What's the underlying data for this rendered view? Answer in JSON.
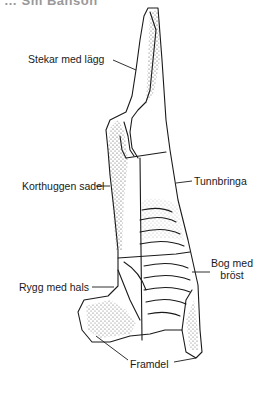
{
  "header": {
    "cut_text": "… Sm Banson"
  },
  "diagram": {
    "labels": {
      "stekar": "Stekar med lägg",
      "korthuggen": "Korthuggen sadel",
      "tunnbringa": "Tunnbringa",
      "bog_line1": "Bog med",
      "bog_line2": "bröst",
      "rygg": "Rygg med hals",
      "framdel": "Framdel"
    },
    "colors": {
      "line": "#1a1a1a",
      "stipple": "#333333",
      "background": "#ffffff"
    }
  }
}
